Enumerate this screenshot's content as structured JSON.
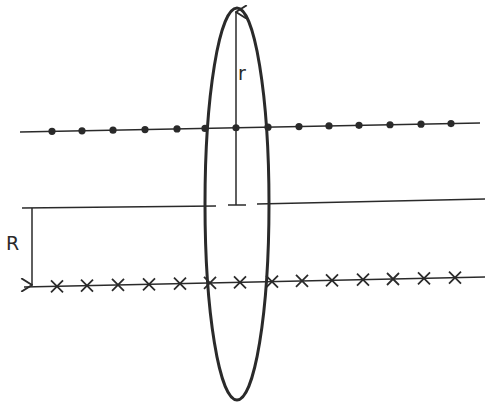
{
  "diagram": {
    "labels": {
      "small_radius": "r",
      "large_distance": "R"
    },
    "colors": {
      "ink": "#2a2a2a",
      "background": "#ffffff"
    },
    "upper_wire": {
      "marker": "dot",
      "marker_count": 14,
      "marker_x": [
        52,
        82,
        113,
        145,
        177,
        205,
        236,
        268,
        299,
        329,
        359,
        390,
        421,
        451
      ]
    },
    "lower_wire": {
      "marker": "cross",
      "marker_count": 14,
      "marker_x": [
        57,
        87,
        118,
        149,
        180,
        210,
        240,
        272,
        302,
        332,
        363,
        393,
        424,
        455
      ]
    },
    "loop": {
      "shape": "ellipse",
      "description": "vertical loop crossing both wires"
    }
  }
}
